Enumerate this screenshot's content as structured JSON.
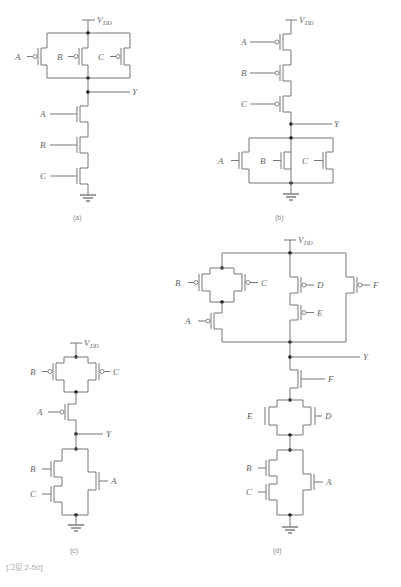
{
  "figure": {
    "caption": "[그림 2-50]",
    "supply_label": "V",
    "supply_sub": "DD",
    "output_label": "Y"
  },
  "circuits": [
    {
      "id": "a",
      "label": "(a)",
      "pullup": {
        "topology": "parallel",
        "type": "PMOS",
        "inputs": [
          "A",
          "B",
          "C"
        ]
      },
      "pulldown": {
        "topology": "series",
        "type": "NMOS",
        "inputs": [
          "A",
          "B",
          "C"
        ]
      }
    },
    {
      "id": "b",
      "label": "(b)",
      "pullup": {
        "topology": "series",
        "type": "PMOS",
        "inputs": [
          "A",
          "B",
          "C"
        ]
      },
      "pulldown": {
        "topology": "parallel",
        "type": "NMOS",
        "inputs": [
          "A",
          "B",
          "C"
        ]
      }
    },
    {
      "id": "c",
      "label": "(c)",
      "pullup": {
        "topology": "(B || C) series A",
        "type": "PMOS",
        "inputs": [
          "B",
          "C",
          "A"
        ]
      },
      "pulldown": {
        "topology": "(B series C) || A",
        "type": "NMOS",
        "inputs": [
          "B",
          "C",
          "A"
        ]
      }
    },
    {
      "id": "d",
      "label": "(d)",
      "pullup": {
        "topology": "((B || C) series A) || (D series E) || F",
        "type": "PMOS",
        "inputs": [
          "B",
          "C",
          "A",
          "D",
          "E",
          "F"
        ]
      },
      "pulldown": {
        "topology": "F series (E || D) series ((B series C) || A)",
        "type": "NMOS",
        "inputs": [
          "F",
          "E",
          "D",
          "B",
          "C",
          "A"
        ]
      }
    }
  ],
  "labels": {
    "a": {
      "p": [
        "A",
        "B",
        "C"
      ],
      "n": [
        "A",
        "B",
        "C"
      ],
      "cap": "(a)"
    },
    "b": {
      "p": [
        "A",
        "B",
        "C"
      ],
      "n": [
        "A",
        "B",
        "C"
      ],
      "cap": "(b)"
    },
    "c": {
      "p": [
        "B",
        "C",
        "A"
      ],
      "n": [
        "B",
        "C",
        "A"
      ],
      "cap": "(c)"
    },
    "d": {
      "p": [
        "B",
        "C",
        "A",
        "D",
        "E",
        "F"
      ],
      "n": [
        "F",
        "E",
        "D",
        "B",
        "C",
        "A"
      ],
      "cap": "(d)"
    }
  }
}
